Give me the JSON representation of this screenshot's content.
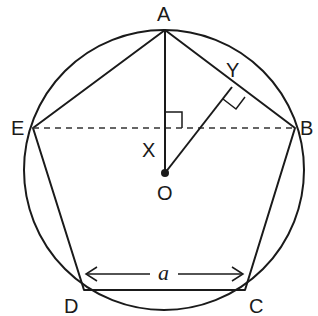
{
  "diagram": {
    "type": "regular-pentagon-inscribed-in-circle",
    "vertices": {
      "A": "A",
      "B": "B",
      "C": "C",
      "D": "D",
      "E": "E"
    },
    "points": {
      "O": "O",
      "X": "X",
      "Y": "Y"
    },
    "side_label": "a",
    "elements": [
      "circumscribed circle centered at O",
      "pentagon ABCDE",
      "segment AO",
      "segment OY perpendicular to AB",
      "dashed segment EB",
      "right angle at X (AO ⟂ EB)",
      "right angle at Y (OY ⟂ AB)",
      "dimension arrow a spanning DC"
    ]
  }
}
